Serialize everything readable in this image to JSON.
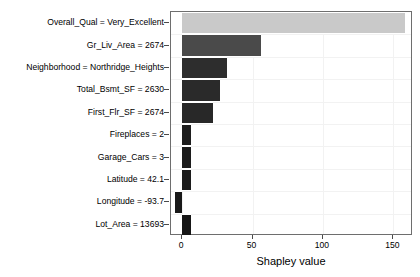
{
  "chart_data": {
    "type": "bar",
    "orientation": "horizontal",
    "title": "",
    "xlabel": "Shapley value",
    "ylabel": "",
    "xlim": [
      -8,
      164
    ],
    "xticks": [
      0,
      50,
      100,
      150
    ],
    "xticklabels": [
      "0",
      "50",
      "100",
      "150"
    ],
    "grid": true,
    "legend": null,
    "categories": [
      "Overall_Qual = Very_Excellent",
      "Gr_Liv_Area = 2674",
      "Neighborhood = Northridge_Heights",
      "Total_Bsmt_SF = 2630",
      "First_Flr_SF = 2674",
      "Fireplaces = 2",
      "Garage_Cars = 3",
      "Latitude = 42.1",
      "Longitude = -93.7",
      "Lot_Area = 13693"
    ],
    "values": [
      158,
      56,
      32,
      27,
      22,
      6,
      6,
      6,
      -5,
      6
    ],
    "colors": [
      "#c9c9c9",
      "#4a4a4a",
      "#2d2d2d",
      "#2a2a2a",
      "#282828",
      "#1e1e1e",
      "#1c1c1c",
      "#1c1c1c",
      "#191919",
      "#161616"
    ]
  },
  "axis": {
    "xtitle": "Shapley value"
  }
}
